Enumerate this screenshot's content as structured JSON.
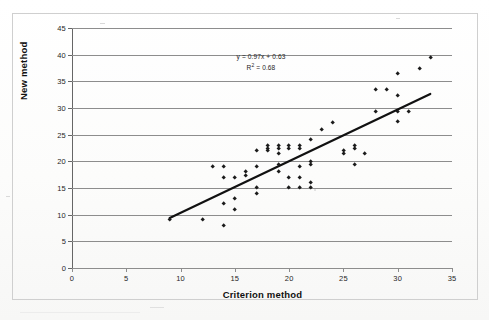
{
  "chart_data": {
    "type": "scatter",
    "title": "",
    "xlabel": "Criterion method",
    "ylabel": "New method",
    "xlim": [
      0,
      35
    ],
    "ylim": [
      0,
      45
    ],
    "xticks": [
      0,
      5,
      10,
      15,
      20,
      25,
      30,
      35
    ],
    "yticks": [
      0,
      5,
      10,
      15,
      20,
      25,
      30,
      35,
      40,
      45
    ],
    "grid": "horizontal",
    "legend": "none",
    "marker": "diamond",
    "marker_color": "#1b1b1b",
    "annotations": {
      "equation": "y = 0.97x + 0.63",
      "r_squared_label": "R",
      "r_squared_exp": "2",
      "r_squared_value": " = 0.68",
      "r_squared_full": "R² = 0.68"
    },
    "trendline": {
      "slope": 0.97,
      "intercept": 0.63,
      "x_start": 9,
      "x_end": 33,
      "y_start": 9.36,
      "y_end": 32.64,
      "color": "#111111",
      "width_px": 2.2
    },
    "points": [
      [
        9,
        9
      ],
      [
        12,
        9
      ],
      [
        13,
        19
      ],
      [
        14,
        19
      ],
      [
        14,
        17
      ],
      [
        14,
        12
      ],
      [
        14,
        8
      ],
      [
        15,
        17
      ],
      [
        15,
        13
      ],
      [
        15,
        11
      ],
      [
        16,
        18
      ],
      [
        16,
        17.4
      ],
      [
        17,
        22
      ],
      [
        17,
        19
      ],
      [
        17,
        15
      ],
      [
        17,
        14
      ],
      [
        18,
        23
      ],
      [
        18,
        22.4
      ],
      [
        18,
        22
      ],
      [
        19,
        23
      ],
      [
        19,
        22.4
      ],
      [
        19,
        21.4
      ],
      [
        19,
        19.4
      ],
      [
        19,
        18
      ],
      [
        20,
        23
      ],
      [
        20,
        22.4
      ],
      [
        20,
        17
      ],
      [
        20,
        15
      ],
      [
        21,
        23
      ],
      [
        21,
        22.4
      ],
      [
        21,
        19
      ],
      [
        21,
        17
      ],
      [
        21,
        15
      ],
      [
        22,
        24
      ],
      [
        22,
        20
      ],
      [
        22,
        19.4
      ],
      [
        22,
        16
      ],
      [
        22,
        15
      ],
      [
        23,
        26
      ],
      [
        24,
        27.2
      ],
      [
        25,
        22
      ],
      [
        25,
        21.4
      ],
      [
        26,
        23
      ],
      [
        26,
        22.4
      ],
      [
        26,
        19.4
      ],
      [
        27,
        21.4
      ],
      [
        28,
        33.4
      ],
      [
        28,
        29.4
      ],
      [
        29,
        33.4
      ],
      [
        30,
        36.4
      ],
      [
        30,
        32.4
      ],
      [
        30,
        29.4
      ],
      [
        30,
        27.4
      ],
      [
        31,
        29.4
      ],
      [
        32,
        37.4
      ],
      [
        33,
        39.4
      ]
    ]
  },
  "axis": {
    "x_title": "Criterion method",
    "y_title": "New method"
  }
}
